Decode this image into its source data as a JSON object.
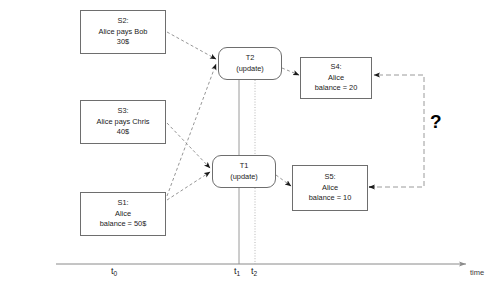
{
  "diagram": {
    "nodes": [
      {
        "id": "S2",
        "kind": "state",
        "lines": [
          "S2:",
          "Alice pays Bob",
          "30$"
        ],
        "x": 80,
        "y": 10,
        "w": 86,
        "h": 44
      },
      {
        "id": "S3",
        "kind": "state",
        "lines": [
          "S3:",
          "Alice pays Chris",
          "40$"
        ],
        "x": 80,
        "y": 100,
        "w": 86,
        "h": 44
      },
      {
        "id": "S1",
        "kind": "state",
        "lines": [
          "S1:",
          "Alice",
          "balance = 50$"
        ],
        "x": 80,
        "y": 192,
        "w": 86,
        "h": 44
      },
      {
        "id": "T2",
        "kind": "transaction",
        "lines": [
          "T2",
          "(update)"
        ],
        "x": 218,
        "y": 47,
        "w": 64,
        "h": 33
      },
      {
        "id": "T1",
        "kind": "transaction",
        "lines": [
          "T1",
          "(update)"
        ],
        "x": 212,
        "y": 155,
        "w": 64,
        "h": 33
      },
      {
        "id": "S4",
        "kind": "state",
        "lines": [
          "S4:",
          "Alice",
          "balance = 20"
        ],
        "x": 300,
        "y": 57,
        "w": 72,
        "h": 42
      },
      {
        "id": "S5",
        "kind": "state",
        "lines": [
          "S5:",
          "Alice",
          "balance = 10"
        ],
        "x": 292,
        "y": 165,
        "w": 76,
        "h": 46
      }
    ],
    "question_marker": {
      "label": "?",
      "x": 430,
      "y": 112
    },
    "axis": {
      "y": 264,
      "x_start": 56,
      "x_end": 466,
      "time_label": "time",
      "time_label_x": 470,
      "time_label_y": 268,
      "ticks": [
        {
          "label": "t",
          "sub": "0",
          "x": 111,
          "y": 266,
          "line": false
        },
        {
          "label": "t",
          "sub": "1",
          "x": 234,
          "y": 266,
          "line": true,
          "style": "solid",
          "line_x": 239,
          "line_top": 80
        },
        {
          "label": "t",
          "sub": "2",
          "x": 251,
          "y": 266,
          "line": true,
          "style": "dotted",
          "line_x": 255,
          "line_top": 80
        }
      ]
    },
    "colors": {
      "node_border": "#6e6e6e",
      "txn_border": "#6e6e6e",
      "edge": "#8a8a8a",
      "axis": "#8a8a8a",
      "text": "#1a1a1a",
      "background": "#ffffff",
      "question": "#000000",
      "timeline_solid": "#9a9a9a",
      "timeline_dotted": "#b5b5b5"
    },
    "edges": [
      {
        "from": "S2",
        "to": "T2",
        "style": "dashed",
        "x1": 167,
        "y1": 32,
        "x2": 216,
        "y2": 59
      },
      {
        "from": "S1",
        "to": "T2",
        "style": "dashed",
        "x1": 167,
        "y1": 196,
        "x2": 216,
        "y2": 64
      },
      {
        "from": "S3",
        "to": "T1",
        "style": "dashed",
        "x1": 167,
        "y1": 123,
        "x2": 210,
        "y2": 168
      },
      {
        "from": "S1",
        "to": "T1",
        "style": "dashed",
        "x1": 167,
        "y1": 200,
        "x2": 210,
        "y2": 172
      },
      {
        "from": "T2",
        "to": "S4",
        "style": "dashed",
        "x1": 282,
        "y1": 68,
        "x2": 299,
        "y2": 75
      },
      {
        "from": "T1",
        "to": "S5",
        "style": "dashed",
        "x1": 276,
        "y1": 175,
        "x2": 291,
        "y2": 186
      }
    ],
    "conflict_bracket": {
      "style": "dashed",
      "from": "S5",
      "to": "S4",
      "points": [
        [
          369,
          187
        ],
        [
          424,
          187
        ],
        [
          424,
          75
        ],
        [
          374,
          75
        ]
      ]
    }
  }
}
